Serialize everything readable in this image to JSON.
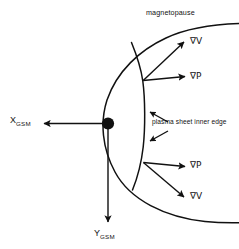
{
  "figure": {
    "type": "schematic-diagram",
    "background_color": "#ffffff",
    "stroke_color": "#111111"
  },
  "labels": {
    "magnetopause": "magnetopause",
    "plasma_sheet_inner_edge": "plasma sheet inner edge",
    "gradient_velocity": "∇V",
    "gradient_pressure": "∇P"
  },
  "axes": {
    "x_axis": {
      "symbol": "X",
      "subscript": "GSM",
      "direction": "left",
      "origin_label": "earth"
    },
    "y_axis": {
      "symbol": "Y",
      "subscript": "GSM",
      "direction": "down",
      "origin_label": "earth"
    }
  },
  "vectors": [
    {
      "name": "gradV-upper",
      "label": "∇V",
      "origin": "plasma-sheet-inner-edge-dusk",
      "direction": "up-right"
    },
    {
      "name": "gradP-upper",
      "label": "∇P",
      "origin": "plasma-sheet-inner-edge-dusk",
      "direction": "right"
    },
    {
      "name": "gradP-lower",
      "label": "∇P",
      "origin": "plasma-sheet-inner-edge-dawn",
      "direction": "right"
    },
    {
      "name": "gradV-lower",
      "label": "∇V",
      "origin": "plasma-sheet-inner-edge-dawn",
      "direction": "down-right"
    }
  ],
  "callouts": [
    {
      "name": "inner-edge-callout-upper",
      "points_to": "plasma-sheet-inner-edge",
      "direction": "up-left"
    },
    {
      "name": "inner-edge-callout-lower",
      "points_to": "plasma-sheet-inner-edge",
      "direction": "down-left"
    }
  ],
  "earth": {
    "name": "earth-marker",
    "shape": "filled-circle",
    "color": "#111111"
  }
}
